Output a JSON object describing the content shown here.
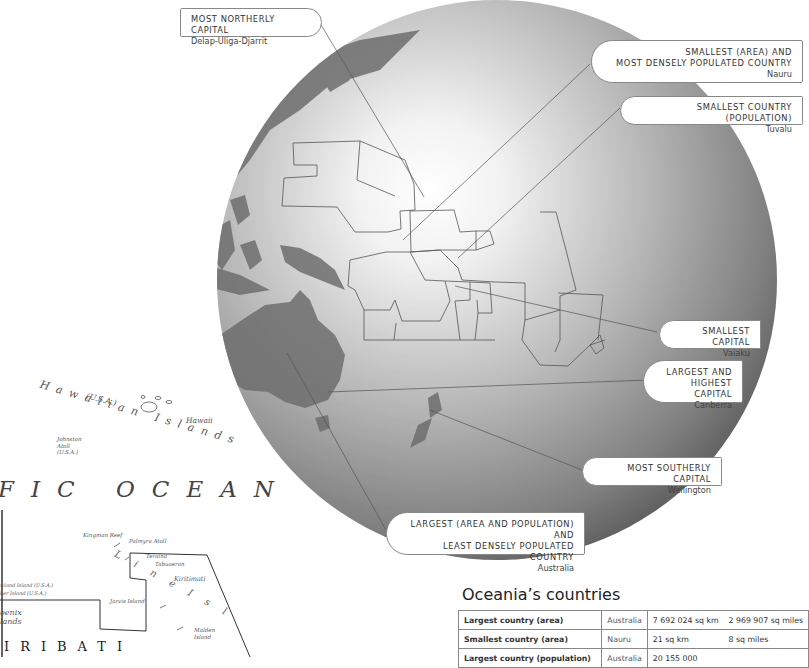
{
  "callouts": {
    "most_northerly": {
      "title": "Most Northerly Capital",
      "sub": "Delap-Uliga-Djarrit"
    },
    "smallest_area": {
      "title_line1": "Smallest (area) and",
      "title_line2": "most densely populated country",
      "sub": "Nauru"
    },
    "smallest_population": {
      "title": "Smallest country (population)",
      "sub": "Tuvalu"
    },
    "smallest_capital": {
      "title": "Smallest capital",
      "sub": "Vaiaku"
    },
    "largest_capital": {
      "title_line1": "Largest and",
      "title_line2": "highest capital",
      "sub": "Canberra"
    },
    "most_southerly": {
      "title": "Most southerly capital",
      "sub": "Wellington"
    },
    "largest_country": {
      "title_line1": "Largest (area and population) and",
      "title_line2": "least densely populated country",
      "sub": "Australia"
    }
  },
  "map_labels": {
    "hawaiian_islands": "Hawaiian Islands",
    "usa_hawaii": "(U.S.A.)",
    "hawaii": "Hawaii",
    "johnston_line1": "Johnston",
    "johnston_line2": "Atoll",
    "johnston_line3": "(U.S.A.)",
    "ocean": "FIC OCEAN",
    "kingman_reef": "Kingman Reef",
    "palmyra_atoll": "Palmyra Atoll",
    "teraina": "Teraina",
    "tabuaeran": "Tabuaeran",
    "kiritimati": "Kiritimati",
    "howland_island": "wland Island (U.S.A.)",
    "baker_island": "ker Island (U.S.A.)",
    "jarvis_island": "Jarvis Island",
    "phoenix_line1": "oenix",
    "phoenix_line2": "lands",
    "malden_line1": "Malden",
    "malden_line2": "Island",
    "line_islands": "L i n e   I s l",
    "kiribati": "IRIBATI"
  },
  "table": {
    "title": "Oceania’s countries",
    "rows": [
      {
        "label": "Largest country (area)",
        "country": "Australia",
        "value_km": "7 692 024 sq km",
        "value_mi": "2 969 907 sq miles"
      },
      {
        "label": "Smallest country (area)",
        "country": "Nauru",
        "value_km": "21 sq km",
        "value_mi": "8 sq miles"
      },
      {
        "label": "Largest country (population)",
        "country": "Australia",
        "value_km": "20 155 000",
        "value_mi": ""
      }
    ]
  },
  "colors": {
    "globe_light": "#ffffff",
    "globe_dark": "#5e5e5e",
    "land": "#6f6f6f",
    "border_line": "#555555",
    "callout_border": "#888888"
  }
}
